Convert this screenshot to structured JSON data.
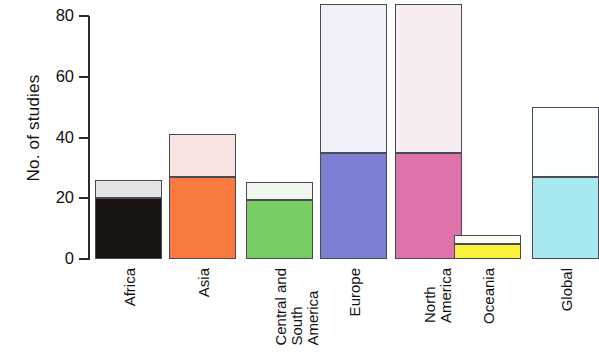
{
  "chart_data": {
    "type": "bar",
    "title": "",
    "subtitle": "",
    "xlabel": "",
    "ylabel": "No. of studies",
    "ylim": [
      0,
      86
    ],
    "yticks": [
      0,
      20,
      40,
      60,
      80
    ],
    "ytick_labels": [
      "0",
      "20",
      "40",
      "60",
      "80"
    ],
    "grid": false,
    "legend": "none",
    "stacked": true,
    "note": "Stacked bars; each region has a dark/saturated lower segment and a pale upper segment. The Global bar is clipped by the right edge of the figure.",
    "categories": [
      "Africa",
      "Asia",
      "Central and South America",
      "Europe",
      "North America",
      "Oceania",
      "Global"
    ],
    "series": [
      {
        "name": "lower segment",
        "values": [
          20,
          27,
          19.5,
          35,
          35,
          5,
          27
        ]
      },
      {
        "name": "upper segment",
        "values": [
          6,
          14,
          6,
          49,
          49,
          3,
          23
        ]
      }
    ],
    "totals": [
      26,
      41,
      25.5,
      84,
      84,
      8,
      50
    ],
    "bar_colors": [
      {
        "category": "Africa",
        "lower": "#1a1410",
        "upper": "#e2e4e6"
      },
      {
        "category": "Asia",
        "lower": "#f9793f",
        "upper": "#f7e3e2"
      },
      {
        "category": "Central and South America",
        "lower": "#76cd63",
        "upper": "#f0f8ee"
      },
      {
        "category": "Europe",
        "lower": "#7b7fd4",
        "upper": "#f0f0f8"
      },
      {
        "category": "North America",
        "lower": "#de73ac",
        "upper": "#f8ecf3"
      },
      {
        "category": "Oceania",
        "lower": "#f9f13c",
        "upper": "#fdfdf4"
      },
      {
        "category": "Global",
        "lower": "#a8e8ef",
        "upper": "#fbfeff"
      }
    ],
    "axis_color": "#2b2b2b",
    "bar_outline_color": "#4a4a52"
  },
  "axis": {
    "ylabel": "No. of studies",
    "ytick_labels": [
      "0",
      "20",
      "40",
      "60",
      "80"
    ]
  },
  "xaxis": {
    "labels": [
      {
        "text": "Africa",
        "lines": [
          "Africa"
        ]
      },
      {
        "text": "Asia",
        "lines": [
          "Asia"
        ]
      },
      {
        "text": "Central and South America",
        "lines": [
          "Central and",
          "South",
          "America"
        ]
      },
      {
        "text": "Europe",
        "lines": [
          "Europe"
        ]
      },
      {
        "text": "North America",
        "lines": [
          "North",
          "America"
        ]
      },
      {
        "text": "Oceania",
        "lines": [
          "Oceania"
        ]
      },
      {
        "text": "Global",
        "lines": [
          "Global"
        ]
      }
    ]
  }
}
